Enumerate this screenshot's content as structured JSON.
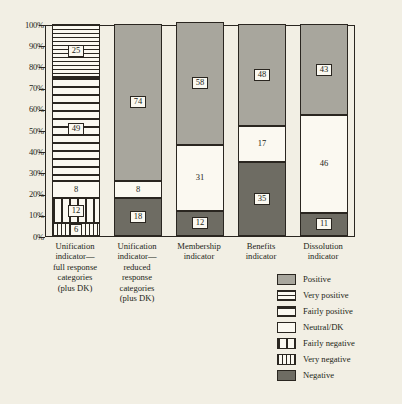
{
  "chart_data": {
    "type": "bar",
    "title": "",
    "subtitle": "",
    "xlabel": "",
    "ylabel": "",
    "ylim": [
      0,
      100
    ],
    "grid": false,
    "stacked": true,
    "stacked_percent": true,
    "legend_position": "bottom-right",
    "ytick_labels": [
      "100%",
      "90%",
      "80%",
      "70%",
      "60%",
      "50%",
      "40%",
      "30%",
      "20%",
      "10%",
      "0%"
    ],
    "ytick_values": [
      100,
      90,
      80,
      70,
      60,
      50,
      40,
      30,
      20,
      10,
      0
    ],
    "categories": [
      "Unification indicator—full response categories (plus DK)",
      "Unification indicator—reduced response categories (plus DK)",
      "Membership indicator",
      "Benefits indicator",
      "Dissolution indicator"
    ],
    "series": [
      {
        "name": "Positive",
        "pattern": "solid-gray",
        "color": "#a8a69d",
        "values": [
          null,
          74,
          58,
          48,
          43
        ]
      },
      {
        "name": "Very positive",
        "pattern": "fine-horizontal",
        "color": "#fbf9f1",
        "values": [
          25,
          null,
          null,
          null,
          null
        ]
      },
      {
        "name": "Fairly positive",
        "pattern": "coarse-horizontal",
        "color": "#fbf9f1",
        "values": [
          49,
          null,
          null,
          null,
          null
        ]
      },
      {
        "name": "Neutral/DK",
        "pattern": "white",
        "color": "#fbf9f1",
        "values": [
          8,
          8,
          31,
          17,
          46
        ]
      },
      {
        "name": "Fairly negative",
        "pattern": "coarse-vertical",
        "color": "#fbf9f1",
        "values": [
          12,
          null,
          null,
          null,
          null
        ]
      },
      {
        "name": "Very negative",
        "pattern": "fine-vertical",
        "color": "#fbf9f1",
        "values": [
          6,
          null,
          null,
          null,
          null
        ]
      },
      {
        "name": "Negative",
        "pattern": "solid-dark-gray",
        "color": "#6e6c63",
        "values": [
          null,
          18,
          12,
          35,
          11
        ]
      }
    ],
    "bars": [
      {
        "category": "Unification indicator—full response categories (plus DK)",
        "segments": [
          {
            "label": "25",
            "value": 25,
            "series": "Very positive"
          },
          {
            "label": "49",
            "value": 49,
            "series": "Fairly positive"
          },
          {
            "label": "8",
            "value": 8,
            "series": "Neutral/DK"
          },
          {
            "label": "12",
            "value": 12,
            "series": "Fairly negative"
          },
          {
            "label": "6",
            "value": 6,
            "series": "Very negative"
          }
        ]
      },
      {
        "category": "Unification indicator—reduced response categories (plus DK)",
        "segments": [
          {
            "label": "74",
            "value": 74,
            "series": "Positive"
          },
          {
            "label": "8",
            "value": 8,
            "series": "Neutral/DK"
          },
          {
            "label": "18",
            "value": 18,
            "series": "Negative"
          }
        ]
      },
      {
        "category": "Membership indicator",
        "segments": [
          {
            "label": "58",
            "value": 58,
            "series": "Positive"
          },
          {
            "label": "31",
            "value": 31,
            "series": "Neutral/DK"
          },
          {
            "label": "12",
            "value": 12,
            "series": "Negative"
          }
        ]
      },
      {
        "category": "Benefits indicator",
        "segments": [
          {
            "label": "48",
            "value": 48,
            "series": "Positive"
          },
          {
            "label": "17",
            "value": 17,
            "series": "Neutral/DK"
          },
          {
            "label": "35",
            "value": 35,
            "series": "Negative"
          }
        ]
      },
      {
        "category": "Dissolution indicator",
        "segments": [
          {
            "label": "43",
            "value": 43,
            "series": "Positive"
          },
          {
            "label": "46",
            "value": 46,
            "series": "Neutral/DK"
          },
          {
            "label": "11",
            "value": 11,
            "series": "Negative"
          }
        ]
      }
    ],
    "legend": [
      {
        "label": "Positive",
        "pattern": "solid-gray"
      },
      {
        "label": "Very positive",
        "pattern": "fine-horizontal"
      },
      {
        "label": "Fairly positive",
        "pattern": "coarse-horizontal"
      },
      {
        "label": "Neutral/DK",
        "pattern": "white"
      },
      {
        "label": "Fairly negative",
        "pattern": "coarse-vertical"
      },
      {
        "label": "Very negative",
        "pattern": "fine-vertical"
      },
      {
        "label": "Negative",
        "pattern": "solid-dark-gray"
      }
    ]
  },
  "colors": {
    "background": "#f2efe4",
    "ink": "#2a2620",
    "positive": "#a8a69d",
    "negative": "#6e6c63",
    "neutral": "#fbf9f1"
  },
  "xaxis_labels": [
    {
      "lines": [
        "Unification",
        "indicator—",
        "full response",
        "categories",
        "(plus DK)"
      ]
    },
    {
      "lines": [
        "Unification",
        "indicator—",
        "reduced",
        "response",
        "categories",
        "(plus DK)"
      ]
    },
    {
      "lines": [
        "Membership",
        "indicator"
      ]
    },
    {
      "lines": [
        "Benefits",
        "indicator"
      ]
    },
    {
      "lines": [
        "Dissolution",
        "indicator"
      ]
    }
  ]
}
